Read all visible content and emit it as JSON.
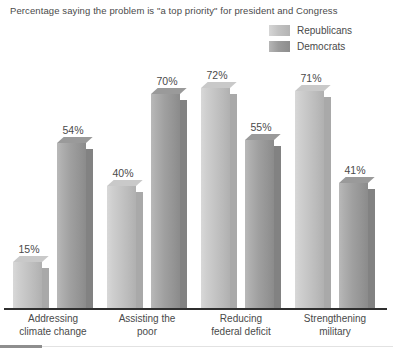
{
  "chart": {
    "title": "Percentage saying the problem is \"a top priority\" for president and Congress",
    "legend": {
      "items": [
        {
          "label": "Republicans",
          "color": "#c4c4c4"
        },
        {
          "label": "Democrats",
          "color": "#9f9f9f"
        }
      ]
    }
  },
  "chart_data": {
    "type": "bar",
    "title": "Percentage saying the problem is \"a top priority\" for president and Congress",
    "xlabel": "",
    "ylabel": "",
    "ylim": [
      0,
      80
    ],
    "grid": false,
    "legend_position": "top-right",
    "categories": [
      "Addressing climate change",
      "Assisting the poor",
      "Reducing federal deficit",
      "Strengthening military"
    ],
    "category_lines": [
      [
        "Addressing",
        "climate change"
      ],
      [
        "Assisting the",
        "poor"
      ],
      [
        "Reducing",
        "federal deficit"
      ],
      [
        "Strengthening",
        "military"
      ]
    ],
    "series": [
      {
        "name": "Republicans",
        "color": "#c4c4c4",
        "values": [
          15,
          40,
          72,
          71
        ],
        "labels": [
          "15%",
          "40%",
          "72%",
          "71%"
        ]
      },
      {
        "name": "Democrats",
        "color": "#9f9f9f",
        "values": [
          54,
          70,
          55,
          41
        ],
        "labels": [
          "54%",
          "70%",
          "55%",
          "41%"
        ]
      }
    ]
  }
}
